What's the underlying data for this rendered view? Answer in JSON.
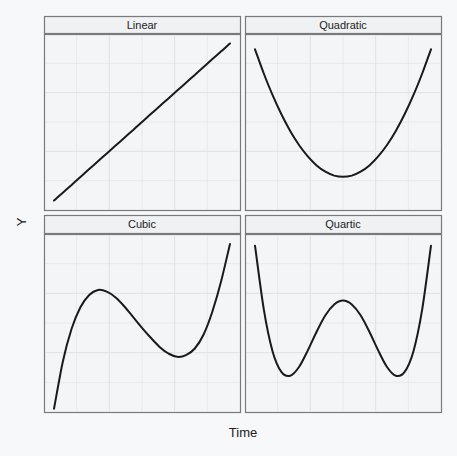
{
  "chart_data": {
    "type": "line",
    "title": "",
    "xlabel": "Time",
    "ylabel": "Y",
    "layout": "facet_wrap 2x2",
    "grid": true,
    "axis_ticks_shown": false,
    "x": [
      -1.0,
      -0.9,
      -0.8,
      -0.7,
      -0.6,
      -0.5,
      -0.4,
      -0.3,
      -0.2,
      -0.1,
      0.0,
      0.1,
      0.2,
      0.3,
      0.4,
      0.5,
      0.6,
      0.7,
      0.8,
      0.9,
      1.0
    ],
    "panels": [
      {
        "name": "Linear",
        "formula": "y = x",
        "values": [
          -1.0,
          -0.9,
          -0.8,
          -0.7,
          -0.6,
          -0.5,
          -0.4,
          -0.3,
          -0.2,
          -0.1,
          0.0,
          0.1,
          0.2,
          0.3,
          0.4,
          0.5,
          0.6,
          0.7,
          0.8,
          0.9,
          1.0
        ]
      },
      {
        "name": "Quadratic",
        "formula": "y = x^2",
        "values": [
          1.0,
          0.81,
          0.64,
          0.49,
          0.36,
          0.25,
          0.16,
          0.09,
          0.04,
          0.01,
          0.0,
          0.01,
          0.04,
          0.09,
          0.16,
          0.25,
          0.36,
          0.49,
          0.64,
          0.81,
          1.0
        ]
      },
      {
        "name": "Cubic",
        "formula": "cubic with local max near x=-0.45 and local min near x=0.45",
        "values": [
          -1.0,
          -0.43,
          -0.03,
          0.23,
          0.38,
          0.44,
          0.42,
          0.35,
          0.24,
          0.11,
          -0.02,
          -0.14,
          -0.25,
          -0.33,
          -0.37,
          -0.35,
          -0.27,
          -0.1,
          0.18,
          0.55,
          1.0
        ]
      },
      {
        "name": "Quartic",
        "formula": "double-well quartic, minima near x=±0.67",
        "values": [
          1.0,
          0.35,
          -0.08,
          -0.29,
          -0.33,
          -0.24,
          -0.07,
          0.12,
          0.29,
          0.4,
          0.44,
          0.4,
          0.29,
          0.12,
          -0.07,
          -0.24,
          -0.33,
          -0.29,
          -0.08,
          0.35,
          1.0
        ]
      }
    ],
    "styles": {
      "line_color": "#1a1a1a",
      "panel_bg": "#f4f5f7",
      "strip_bg": "#f0f1f3",
      "border_color": "#7a7a7a",
      "grid_color": "#dfe1e4"
    }
  },
  "labels": {
    "x_axis": "Time",
    "y_axis": "Y",
    "panels": [
      "Linear",
      "Quadratic",
      "Cubic",
      "Quartic"
    ]
  }
}
